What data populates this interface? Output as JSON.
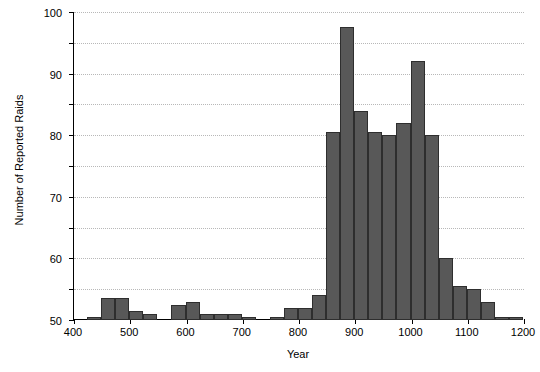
{
  "chart_data": {
    "type": "bar",
    "title": "",
    "xlabel": "Year",
    "ylabel": "Number of Reported Raids",
    "xlim": [
      400,
      1200
    ],
    "ylim": [
      0,
      100
    ],
    "bin_width": 25,
    "grid": true,
    "legend": null,
    "bar_color": "#585858",
    "bar_edge_color": "#2e2e2e",
    "xticks": [
      400,
      500,
      600,
      700,
      800,
      900,
      1000,
      1100,
      1200
    ],
    "xtick_labels": [
      "400",
      "500",
      "600",
      "700",
      "800",
      "900",
      "1000",
      "1100",
      "1200"
    ],
    "yticks": [
      0,
      10,
      20,
      30,
      40,
      50,
      60,
      70,
      80,
      90,
      100
    ],
    "ytick_labels": [
      "0",
      "10",
      "20",
      "30",
      "40",
      "50",
      "60",
      "70",
      "80",
      "90",
      "100"
    ],
    "bins": [
      {
        "x0": 400,
        "x1": 425,
        "value": 0
      },
      {
        "x0": 425,
        "x1": 450,
        "value": 1
      },
      {
        "x0": 450,
        "x1": 475,
        "value": 7
      },
      {
        "x0": 475,
        "x1": 500,
        "value": 7
      },
      {
        "x0": 500,
        "x1": 525,
        "value": 3
      },
      {
        "x0": 525,
        "x1": 550,
        "value": 2
      },
      {
        "x0": 550,
        "x1": 575,
        "value": 0
      },
      {
        "x0": 575,
        "x1": 600,
        "value": 5
      },
      {
        "x0": 600,
        "x1": 625,
        "value": 6
      },
      {
        "x0": 625,
        "x1": 650,
        "value": 2
      },
      {
        "x0": 650,
        "x1": 675,
        "value": 2
      },
      {
        "x0": 675,
        "x1": 700,
        "value": 2
      },
      {
        "x0": 700,
        "x1": 725,
        "value": 1
      },
      {
        "x0": 725,
        "x1": 750,
        "value": 0
      },
      {
        "x0": 750,
        "x1": 775,
        "value": 1
      },
      {
        "x0": 775,
        "x1": 800,
        "value": 4
      },
      {
        "x0": 800,
        "x1": 825,
        "value": 4
      },
      {
        "x0": 825,
        "x1": 850,
        "value": 8
      },
      {
        "x0": 850,
        "x1": 875,
        "value": 61
      },
      {
        "x0": 875,
        "x1": 900,
        "value": 95
      },
      {
        "x0": 900,
        "x1": 925,
        "value": 68
      },
      {
        "x0": 925,
        "x1": 950,
        "value": 61
      },
      {
        "x0": 950,
        "x1": 975,
        "value": 60
      },
      {
        "x0": 975,
        "x1": 1000,
        "value": 64
      },
      {
        "x0": 1000,
        "x1": 1025,
        "value": 84
      },
      {
        "x0": 1025,
        "x1": 1050,
        "value": 60
      },
      {
        "x0": 1050,
        "x1": 1075,
        "value": 20
      },
      {
        "x0": 1075,
        "x1": 1100,
        "value": 11
      },
      {
        "x0": 1100,
        "x1": 1125,
        "value": 10
      },
      {
        "x0": 1125,
        "x1": 1150,
        "value": 6
      },
      {
        "x0": 1150,
        "x1": 1175,
        "value": 1
      },
      {
        "x0": 1175,
        "x1": 1200,
        "value": 1
      }
    ]
  }
}
